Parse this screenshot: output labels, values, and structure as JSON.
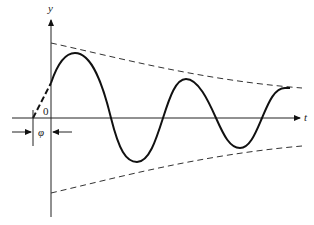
{
  "diagram": {
    "axes": {
      "y_label": "y",
      "x_label": "t",
      "origin_label": "0"
    },
    "annotations": {
      "phase_label": "φ"
    },
    "curves": [
      {
        "name": "damped-oscillation",
        "style": "solid",
        "color": "#111111"
      },
      {
        "name": "upper-envelope",
        "style": "dashed",
        "color": "#333333"
      },
      {
        "name": "lower-envelope",
        "style": "dashed",
        "color": "#333333"
      },
      {
        "name": "phase-extension",
        "style": "dashed-bold",
        "color": "#111111"
      }
    ]
  }
}
